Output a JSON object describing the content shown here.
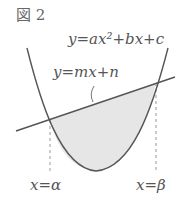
{
  "figure": {
    "title": "図 2",
    "labels": {
      "parabola": "y=ax²+bx+c",
      "line": "y=mx+n",
      "alpha": "x=α",
      "beta": "x=β"
    },
    "colors": {
      "curve": "#555555",
      "shade": "#e6e6e6",
      "dash": "#999999",
      "background": "#ffffff"
    }
  }
}
